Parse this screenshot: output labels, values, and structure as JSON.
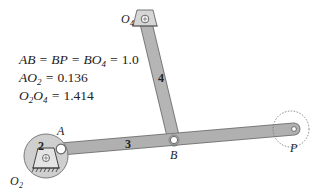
{
  "equations": [
    {
      "parts": [
        {
          "t": "AB = BP = BO"
        },
        {
          "sub": "4"
        },
        {
          "t": " = "
        },
        {
          "n": "1.0"
        }
      ]
    },
    {
      "parts": [
        {
          "t": "AO"
        },
        {
          "sub": "2"
        },
        {
          "t": " = "
        },
        {
          "n": "0.136"
        }
      ]
    },
    {
      "parts": [
        {
          "t": "O"
        },
        {
          "sub": "2"
        },
        {
          "t": "O"
        },
        {
          "sub": "4"
        },
        {
          "t": " = "
        },
        {
          "n": "1.414"
        }
      ]
    }
  ],
  "equation_text": {
    "line1": "AB = BP = BO4 = 1.0",
    "line2": "AO2 = 0.136",
    "line3": "O2O4 = 1.414"
  },
  "points": {
    "O2": {
      "label": "O",
      "sub": "2"
    },
    "O4": {
      "label": "O",
      "sub": "4"
    },
    "A": {
      "label": "A"
    },
    "B": {
      "label": "B"
    },
    "P": {
      "label": "P"
    }
  },
  "links": {
    "crank": {
      "number": "2"
    },
    "coupler": {
      "number": "3"
    },
    "rocker": {
      "number": "4"
    }
  },
  "colors": {
    "link_fill": "#b3b3b3",
    "link_stroke": "#7a7a7a",
    "disk_fill": "#cfcfcf",
    "ground": "#444444",
    "text": "#222222"
  }
}
